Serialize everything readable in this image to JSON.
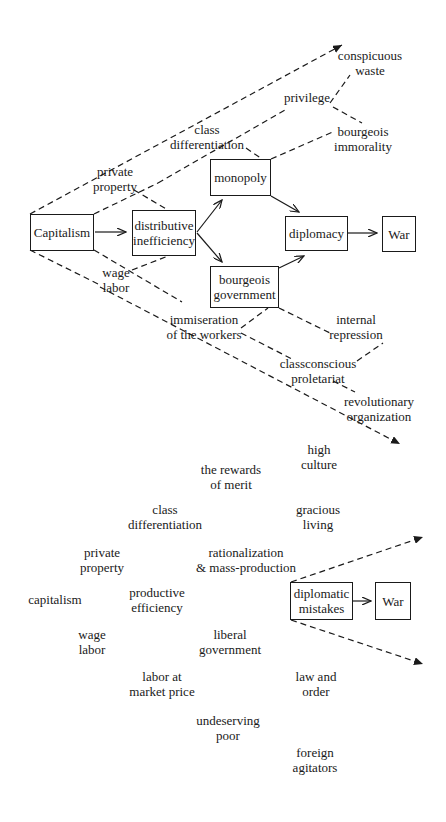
{
  "diagram_a": {
    "boxes": [
      {
        "id": "capitalism",
        "lines": [
          "Capitalism"
        ],
        "x": 30,
        "y": 214,
        "w": 64,
        "h": 37
      },
      {
        "id": "distributive-inefficiency",
        "lines": [
          "distributive",
          "inefficiency"
        ],
        "x": 132,
        "y": 210,
        "w": 64,
        "h": 46
      },
      {
        "id": "monopoly",
        "lines": [
          "monopoly"
        ],
        "x": 210,
        "y": 159,
        "w": 61,
        "h": 37
      },
      {
        "id": "bourgeois-government",
        "lines": [
          "bourgeois",
          "government"
        ],
        "x": 210,
        "y": 266,
        "w": 69,
        "h": 42
      },
      {
        "id": "diplomacy",
        "lines": [
          "diplomacy"
        ],
        "x": 285,
        "y": 216,
        "w": 63,
        "h": 35
      },
      {
        "id": "war",
        "lines": [
          "War"
        ],
        "x": 382,
        "y": 216,
        "w": 34,
        "h": 36
      }
    ],
    "labels": [
      {
        "id": "conspicuous-waste",
        "lines": [
          "conspicuous",
          "waste"
        ],
        "cx": 370,
        "y": 48
      },
      {
        "id": "privilege",
        "lines": [
          "privilege"
        ],
        "cx": 307,
        "y": 90
      },
      {
        "id": "class-differentiation",
        "lines": [
          "class",
          "differentiation"
        ],
        "cx": 207,
        "y": 122
      },
      {
        "id": "bourgeois-immorality",
        "lines": [
          "bourgeois",
          "immorality"
        ],
        "cx": 363,
        "y": 124
      },
      {
        "id": "private-property",
        "lines": [
          "private",
          "property"
        ],
        "cx": 115,
        "y": 164
      },
      {
        "id": "wage-labor",
        "lines": [
          "wage",
          "labor"
        ],
        "cx": 116,
        "y": 265
      },
      {
        "id": "immiseration-of-the-workers",
        "lines": [
          "immiseration",
          "of the workers"
        ],
        "cx": 204,
        "y": 312
      },
      {
        "id": "internal-repression",
        "lines": [
          "internal",
          "repression"
        ],
        "cx": 356,
        "y": 312
      },
      {
        "id": "classconscious-proletariat",
        "lines": [
          "classconscious",
          "proletariat"
        ],
        "cx": 318,
        "y": 356
      },
      {
        "id": "revolutionary-organization",
        "lines": [
          "revolutionary",
          "organization"
        ],
        "cx": 379,
        "y": 394
      }
    ]
  },
  "diagram_b": {
    "boxes": [
      {
        "id": "diplomatic-mistakes",
        "lines": [
          "diplomatic",
          "mistakes"
        ],
        "x": 290,
        "y": 582,
        "w": 63,
        "h": 38
      },
      {
        "id": "war-2",
        "lines": [
          "War"
        ],
        "x": 375,
        "y": 582,
        "w": 36,
        "h": 38
      }
    ],
    "labels": [
      {
        "id": "high-culture",
        "lines": [
          "high",
          "culture"
        ],
        "cx": 319,
        "y": 442
      },
      {
        "id": "the-rewards-of-merit",
        "lines": [
          "the rewards",
          "of merit"
        ],
        "cx": 231,
        "y": 462
      },
      {
        "id": "class-differentiation-2",
        "lines": [
          "class",
          "differentiation"
        ],
        "cx": 165,
        "y": 502
      },
      {
        "id": "gracious-living",
        "lines": [
          "gracious",
          "living"
        ],
        "cx": 318,
        "y": 502
      },
      {
        "id": "private-property-2",
        "lines": [
          "private",
          "property"
        ],
        "cx": 102,
        "y": 545
      },
      {
        "id": "rationalization-mass-production",
        "lines": [
          "rationalization",
          "& mass-production"
        ],
        "cx": 246,
        "y": 545
      },
      {
        "id": "capitalism-2",
        "lines": [
          "capitalism"
        ],
        "cx": 55,
        "y": 592
      },
      {
        "id": "productive-efficiency",
        "lines": [
          "productive",
          "efficiency"
        ],
        "cx": 157,
        "y": 585
      },
      {
        "id": "liberal-government",
        "lines": [
          "liberal",
          "government"
        ],
        "cx": 230,
        "y": 627
      },
      {
        "id": "wage-labor-2",
        "lines": [
          "wage",
          "labor"
        ],
        "cx": 92,
        "y": 627
      },
      {
        "id": "labor-at-market-price",
        "lines": [
          "labor at",
          "market price"
        ],
        "cx": 162,
        "y": 669
      },
      {
        "id": "law-and-order",
        "lines": [
          "law and",
          "order"
        ],
        "cx": 316,
        "y": 669
      },
      {
        "id": "undeserving-poor",
        "lines": [
          "undeserving",
          "poor"
        ],
        "cx": 228,
        "y": 713
      },
      {
        "id": "foreign-agitators",
        "lines": [
          "foreign",
          "agitators"
        ],
        "cx": 315,
        "y": 745
      }
    ]
  }
}
